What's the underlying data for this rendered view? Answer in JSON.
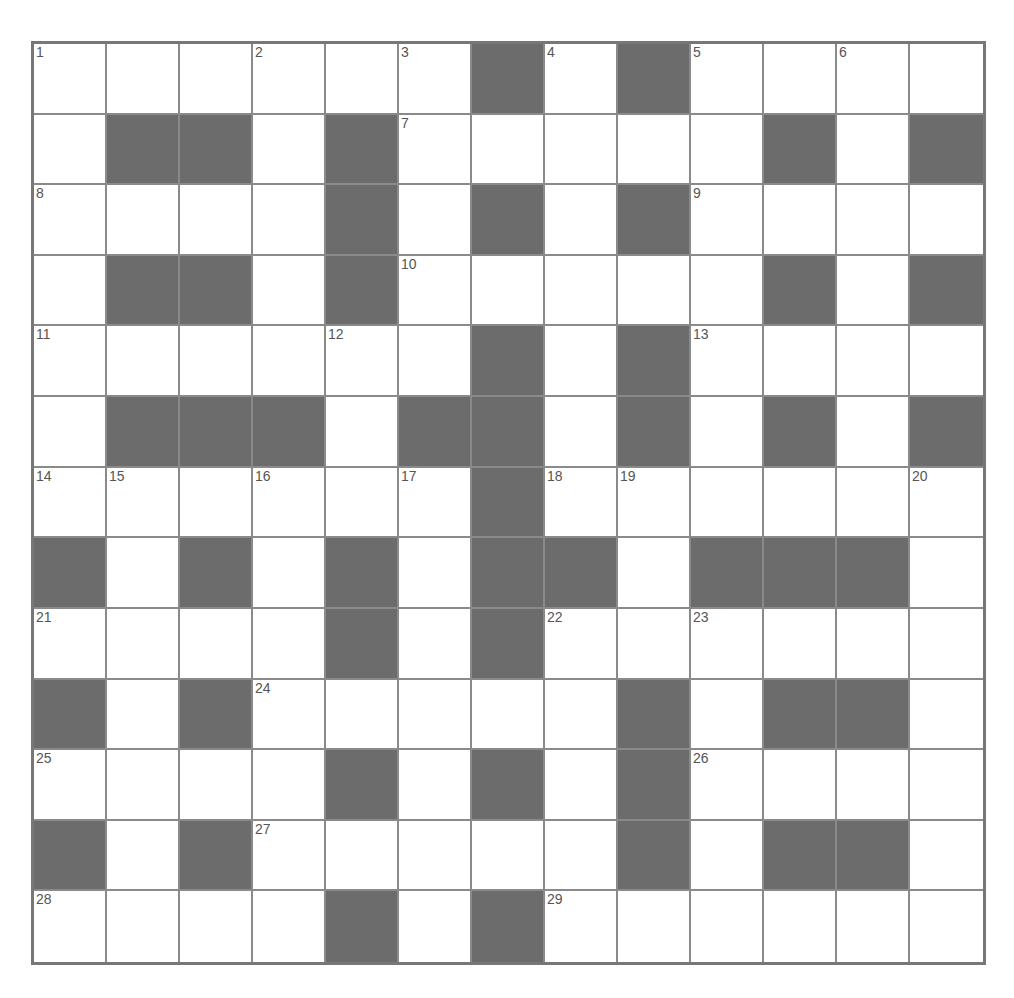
{
  "puzzle": {
    "type": "crossword",
    "rows": 13,
    "cols": 13,
    "colors": {
      "block": "#6c6c6c",
      "cell": "#ffffff",
      "line": "#8a8a8a",
      "border": "#777777",
      "number": "#555555"
    },
    "layout": [
      "1..2.3#4#5.6.",
      ".##.#7....#.#",
      "8...#.#.#9...",
      ".##.#10....#.#",
      "11...12.#.#13...",
      ".###.##.#.#.#",
      "14 15.16.17#18 19...20",
      "#.#.#.##.###.",
      "21...#.#22.23...",
      "#.#24....#.##.",
      "25...#.#.#26...",
      "#.#27....#.##.",
      "28...#.#29....."
    ],
    "grid": [
      [
        "1",
        "",
        "",
        "2",
        "",
        "3",
        "#",
        "4",
        "#",
        "5",
        "",
        "6",
        ""
      ],
      [
        "",
        "#",
        "#",
        "",
        "#",
        "7",
        "",
        "",
        "",
        "",
        "#",
        "",
        "#"
      ],
      [
        "8",
        "",
        "",
        "",
        "#",
        "",
        "#",
        "",
        "#",
        "9",
        "",
        "",
        ""
      ],
      [
        "",
        "#",
        "#",
        "",
        "#",
        "10",
        "",
        "",
        "",
        "",
        "#",
        "",
        "#"
      ],
      [
        "11",
        "",
        "",
        "",
        "12",
        "",
        "#",
        "",
        "#",
        "13",
        "",
        "",
        ""
      ],
      [
        "",
        "#",
        "#",
        "#",
        "",
        "#",
        "#",
        "",
        "#",
        "",
        "#",
        "",
        "#"
      ],
      [
        "14",
        "15",
        "",
        "16",
        "",
        "17",
        "#",
        "18",
        "19",
        "",
        "",
        "",
        "20"
      ],
      [
        "#",
        "",
        "#",
        "",
        "#",
        "",
        "#",
        "#",
        "",
        "#",
        "#",
        "#",
        ""
      ],
      [
        "21",
        "",
        "",
        "",
        "#",
        "",
        "#",
        "22",
        "",
        "23",
        "",
        "",
        ""
      ],
      [
        "#",
        "",
        "#",
        "24",
        "",
        "",
        "",
        "",
        "#",
        "",
        "#",
        "#",
        ""
      ],
      [
        "25",
        "",
        "",
        "",
        "#",
        "",
        "#",
        "",
        "#",
        "26",
        "",
        "",
        ""
      ],
      [
        "#",
        "",
        "#",
        "27",
        "",
        "",
        "",
        "",
        "#",
        "",
        "#",
        "#",
        ""
      ],
      [
        "28",
        "",
        "",
        "",
        "#",
        "",
        "#",
        "29",
        "",
        "",
        "",
        "",
        ""
      ]
    ],
    "clue_numbers": [
      "1",
      "2",
      "3",
      "4",
      "5",
      "6",
      "7",
      "8",
      "9",
      "10",
      "11",
      "12",
      "13",
      "14",
      "15",
      "16",
      "17",
      "18",
      "19",
      "20",
      "21",
      "22",
      "23",
      "24",
      "25",
      "26",
      "27",
      "28",
      "29"
    ]
  }
}
